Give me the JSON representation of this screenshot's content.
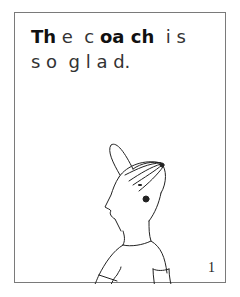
{
  "page": {
    "text_lines": [
      {
        "segments": [
          {
            "text": "Th",
            "bold": true
          },
          {
            "text": " e  ",
            "bold": false
          },
          {
            "text": "c ",
            "bold": false
          },
          {
            "text": "oa ch",
            "bold": true
          },
          {
            "text": "  i s",
            "bold": false
          }
        ]
      },
      {
        "segments": [
          {
            "text": "s o  g l a d.",
            "bold": false
          }
        ]
      }
    ],
    "sentence": "The coach is so glad.",
    "illustration": "coach-with-cap-and-whistle",
    "page_number": "1"
  },
  "colors": {
    "border": "#7a7a7a",
    "text": "#1a1a1a",
    "background": "#ffffff"
  }
}
